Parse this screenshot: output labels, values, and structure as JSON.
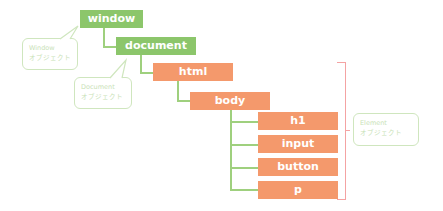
{
  "diagram": {
    "type": "DOM tree",
    "nodes": [
      {
        "id": "window",
        "label": "window",
        "kind": "object"
      },
      {
        "id": "document",
        "label": "document",
        "kind": "object"
      },
      {
        "id": "html",
        "label": "html",
        "kind": "element"
      },
      {
        "id": "body",
        "label": "body",
        "kind": "element"
      },
      {
        "id": "h1",
        "label": "h1",
        "kind": "element"
      },
      {
        "id": "input",
        "label": "input",
        "kind": "element"
      },
      {
        "id": "button",
        "label": "button",
        "kind": "element"
      },
      {
        "id": "p",
        "label": "p",
        "kind": "element"
      }
    ],
    "edges": [
      [
        "window",
        "document"
      ],
      [
        "document",
        "html"
      ],
      [
        "html",
        "body"
      ],
      [
        "body",
        "h1"
      ],
      [
        "body",
        "input"
      ],
      [
        "body",
        "button"
      ],
      [
        "body",
        "p"
      ]
    ],
    "callouts": {
      "window": {
        "line1": "Window",
        "line2": "オブジェクト"
      },
      "document": {
        "line1": "Document",
        "line2": "オブジェクト"
      },
      "element": {
        "line1": "Element",
        "line2": "オブジェクト"
      }
    },
    "colors": {
      "object": "#8cc66b",
      "element": "#f4996c",
      "connector": "#9fd07e",
      "bracket": "#f4a3a3",
      "callout_border": "#cfe6be"
    }
  }
}
